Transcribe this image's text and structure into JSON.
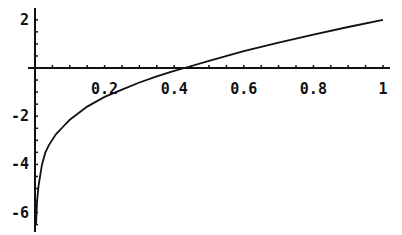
{
  "chart_data": {
    "type": "line",
    "title": "",
    "xlabel": "",
    "ylabel": "",
    "xlim": [
      0,
      1
    ],
    "ylim": [
      -6.5,
      2.1
    ],
    "grid": false,
    "legend": null,
    "x_ticks": [
      {
        "value": 0.2,
        "label": "0.2"
      },
      {
        "value": 0.4,
        "label": "0.4"
      },
      {
        "value": 0.6,
        "label": "0.6"
      },
      {
        "value": 0.8,
        "label": "0.8"
      },
      {
        "value": 1,
        "label": "1"
      }
    ],
    "y_ticks": [
      {
        "value": 2,
        "label": "2"
      },
      {
        "value": -2,
        "label": "-2"
      },
      {
        "value": -4,
        "label": "-4"
      },
      {
        "value": -6,
        "label": "-6"
      }
    ],
    "series": [
      {
        "name": "f(x)",
        "x": [
          0.003,
          0.006,
          0.01,
          0.02,
          0.03,
          0.04,
          0.06,
          0.08,
          0.1,
          0.15,
          0.2,
          0.25,
          0.3,
          0.35,
          0.4,
          0.43,
          0.5,
          0.6,
          0.7,
          0.8,
          0.9,
          1.0
        ],
        "y": [
          -6.5,
          -5.5,
          -4.9,
          -4.0,
          -3.5,
          -3.2,
          -2.75,
          -2.45,
          -2.15,
          -1.6,
          -1.2,
          -0.9,
          -0.6,
          -0.35,
          -0.12,
          0.0,
          0.3,
          0.7,
          1.05,
          1.38,
          1.7,
          2.0
        ]
      }
    ]
  }
}
